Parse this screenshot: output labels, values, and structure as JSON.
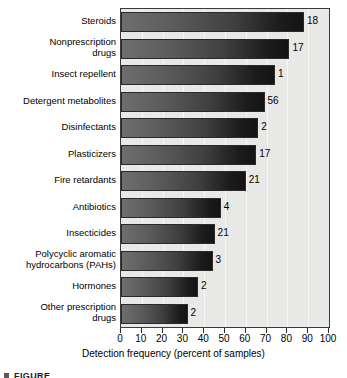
{
  "chart_data": {
    "type": "bar",
    "orientation": "horizontal",
    "title": "",
    "xlabel": "Detection frequency (percent of samples)",
    "ylabel": "",
    "xlim": [
      0,
      100
    ],
    "xticks": [
      0,
      10,
      20,
      30,
      40,
      50,
      60,
      70,
      80,
      90,
      100
    ],
    "grid": true,
    "legend": false,
    "categories": [
      "Steroids",
      "Nonprescription drugs",
      "Insect repellent",
      "Detergent metabolites",
      "Disinfectants",
      "Plasticizers",
      "Fire retardants",
      "Antibiotics",
      "Insecticides",
      "Polycyclic aromatic hydrocarbons (PAHs)",
      "Hormones",
      "Other prescription drugs"
    ],
    "category_lines": [
      [
        "Steroids"
      ],
      [
        "Nonprescription",
        "drugs"
      ],
      [
        "Insect repellent"
      ],
      [
        "Detergent metabolites"
      ],
      [
        "Disinfectants"
      ],
      [
        "Plasticizers"
      ],
      [
        "Fire retardants"
      ],
      [
        "Antibiotics"
      ],
      [
        "Insecticides"
      ],
      [
        "Polycyclic aromatic",
        "hydrocarbons (PAHs)"
      ],
      [
        "Hormones"
      ],
      [
        "Other prescription",
        "drugs"
      ]
    ],
    "values": [
      88,
      81,
      74,
      69,
      66,
      65,
      60,
      48,
      45,
      44,
      37,
      32
    ],
    "annotations": [
      "18",
      "17",
      "1",
      "56",
      "2",
      "17",
      "21",
      "4",
      "21",
      "3",
      "2",
      "2"
    ],
    "bar_color_start": "#6e6e6e",
    "bar_color_end": "#141414",
    "plot_background": "#e8e8e6"
  },
  "figure": {
    "caption_partial": "FIGURE"
  }
}
